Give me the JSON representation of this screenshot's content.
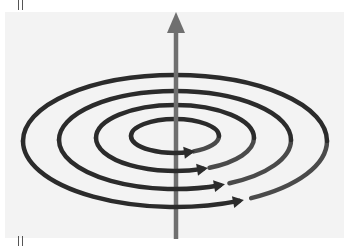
{
  "diagram": {
    "conductor": {
      "direction": "up",
      "color": "#6f6f6f",
      "x": 176,
      "y_top": 12,
      "y_bottom": 239
    },
    "field_lines": {
      "count": 4,
      "color": "#2b2b2b",
      "direction": "counter-clockwise (viewed from above)",
      "rings": [
        {
          "cx": 175,
          "cy": 136,
          "rx": 44,
          "ry": 17,
          "arrow_x": 190
        },
        {
          "cx": 175,
          "cy": 138,
          "rx": 79,
          "ry": 33,
          "arrow_x": 203
        },
        {
          "cx": 175,
          "cy": 140,
          "rx": 116,
          "ry": 49,
          "arrow_x": 220
        },
        {
          "cx": 175,
          "cy": 141,
          "rx": 152,
          "ry": 66,
          "arrow_x": 239
        }
      ]
    },
    "background_color": "#f3f3f3"
  }
}
